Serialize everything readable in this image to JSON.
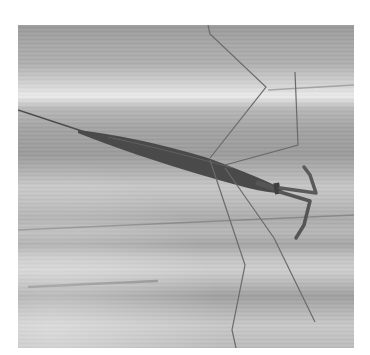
{
  "image": {
    "subject": "Water stick insect on striated leaf surface",
    "style": "grayscale photograph",
    "colors": {
      "background": "#ffffff",
      "surface_light": "#e0e0e0",
      "surface_mid": "#b0b0b0",
      "surface_dark": "#8c8c8c",
      "insect_body": "#4a4a4a",
      "insect_legs": "#6a6a6a"
    }
  }
}
